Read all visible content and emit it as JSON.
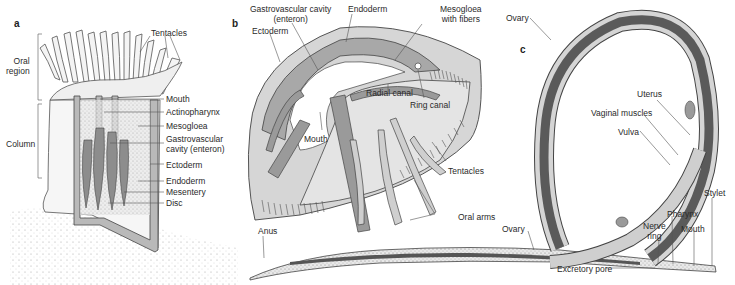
{
  "figure": {
    "panels": [
      {
        "id": "a",
        "subject": "sea anemone (cross-section)",
        "labels": {
          "oral_region": "Oral\nregion",
          "column": "Column",
          "tentacles": "Tentacles",
          "mouth": "Mouth",
          "actinopharynx": "Actinopharynx",
          "mesogloea": "Mesogloea",
          "gastrovascular": "Gastrovascular\ncavity (enteron)",
          "ectoderm": "Ectoderm",
          "endoderm": "Endoderm",
          "mesentery": "Mesentery",
          "disc": "Disc"
        }
      },
      {
        "id": "b",
        "subject": "jellyfish / medusa (cross-section)",
        "labels": {
          "gastrovascular": "Gastrovascular cavity\n(enteron)",
          "endoderm": "Endoderm",
          "mesogloea_fibers": "Mesogloea\nwith fibers",
          "ectoderm": "Ectoderm",
          "radial_canal": "Radial canal",
          "ring_canal": "Ring canal",
          "mouth": "Mouth",
          "tentacles": "Tentacles",
          "oral_arms": "Oral arms"
        }
      },
      {
        "id": "c",
        "subject": "nematode (longitudinal section)",
        "labels": {
          "ovary_top": "Ovary",
          "uterus": "Uterus",
          "vaginal_muscles": "Vaginal muscles",
          "vulva": "Vulva",
          "stylet": "Stylet",
          "pharynx": "Pharynx",
          "nerve_ring": "Nerve\nring",
          "mouth": "Mouth",
          "ovary_bottom": "Ovary",
          "anus": "Anus",
          "excretory_pore": "Excretory pore"
        }
      }
    ]
  }
}
